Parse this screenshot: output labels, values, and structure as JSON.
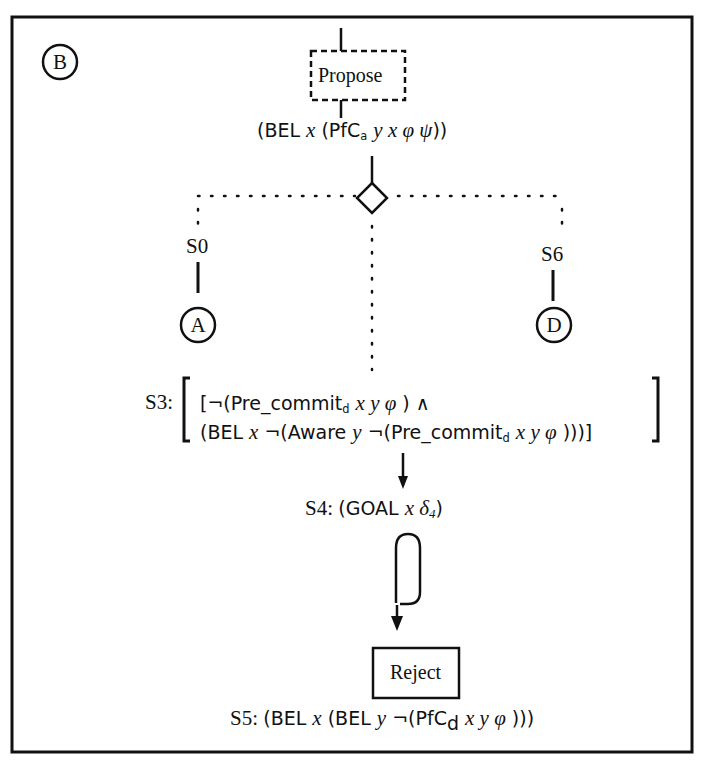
{
  "diagram": {
    "panel_label": "B",
    "top_node": {
      "label": "Propose",
      "style": "dashed-box"
    },
    "top_condition": {
      "parts": [
        "(BEL ",
        "x",
        " (PfC",
        "a",
        " ",
        "y x φ ψ",
        "))"
      ]
    },
    "branch": {
      "symbol": "diamond",
      "left": {
        "state": "S0",
        "target": "A"
      },
      "right": {
        "state": "S6",
        "target": "D"
      },
      "center": {
        "state": "S3"
      }
    },
    "s3": {
      "label": "S3:",
      "line1": [
        "[¬(Pre_commit",
        "d",
        " ",
        "x y φ",
        " ) ∧"
      ],
      "line2": [
        "(BEL ",
        "x",
        " ¬(Aware ",
        "y",
        " ¬(Pre_commit",
        "d",
        " ",
        "x y φ",
        " )))]"
      ]
    },
    "s4": {
      "label": "S4: ",
      "formula": [
        "(GOAL ",
        "x δ",
        "4",
        ")"
      ]
    },
    "end_node": {
      "label": "Reject",
      "style": "solid-box"
    },
    "s5": {
      "label": "S5: ",
      "formula": [
        "(BEL ",
        "x",
        " (BEL ",
        "y",
        " ¬(PfC",
        "d",
        " ",
        "x y φ",
        " )))"
      ]
    },
    "colors": {
      "ink": "#111111",
      "background": "#ffffff"
    }
  }
}
